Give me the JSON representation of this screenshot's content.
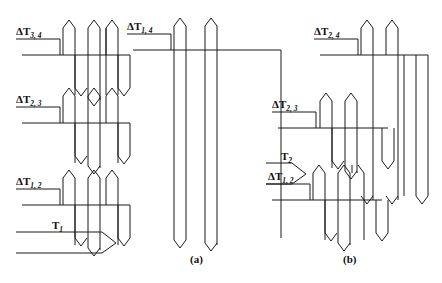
{
  "figure": {
    "type": "interdigital-transducer-diagram",
    "background_color": "#ffffff",
    "line_color": "#1a1a1a",
    "panels": [
      {
        "id": "a",
        "caption": "(a)",
        "labels": [
          {
            "name": "delta-t-3-4",
            "delta": "Δ",
            "symbol": "T",
            "sub": "3, 4"
          },
          {
            "name": "delta-t-2-3",
            "delta": "Δ",
            "symbol": "T",
            "sub": "2, 3"
          },
          {
            "name": "delta-t-1-2",
            "delta": "Δ",
            "symbol": "T",
            "sub": "1, 2"
          },
          {
            "name": "t-1",
            "delta": "",
            "symbol": "T",
            "sub": "1"
          },
          {
            "name": "delta-t-1-4",
            "delta": "Δ",
            "symbol": "T",
            "sub": "1, 4"
          }
        ]
      },
      {
        "id": "b",
        "caption": "(b)",
        "labels": [
          {
            "name": "delta-t-2-4",
            "delta": "Δ",
            "symbol": "T",
            "sub": "2, 4"
          },
          {
            "name": "delta-t-2-3",
            "delta": "Δ",
            "symbol": "T",
            "sub": "2, 3"
          },
          {
            "name": "t-2",
            "delta": "",
            "symbol": "T",
            "sub": "2"
          },
          {
            "name": "delta-t-1-2",
            "delta": "Δ",
            "symbol": "T",
            "sub": "1, 2"
          }
        ]
      }
    ],
    "label_text": {
      "delta_t_3_4": "ΔT",
      "delta_t_3_4_sub": "3, 4",
      "delta_t_2_3_a": "ΔT",
      "delta_t_2_3_a_sub": "2, 3",
      "delta_t_1_2_a": "ΔT",
      "delta_t_1_2_a_sub": "1, 2",
      "t_1": "T",
      "t_1_sub": "1",
      "delta_t_1_4": "ΔT",
      "delta_t_1_4_sub": "1, 4",
      "delta_t_2_4": "ΔT",
      "delta_t_2_4_sub": "2, 4",
      "delta_t_2_3_b": "ΔT",
      "delta_t_2_3_b_sub": "2, 3",
      "t_2": "T",
      "t_2_sub": "2",
      "delta_t_1_2_b": "ΔT",
      "delta_t_1_2_b_sub": "1, 2",
      "caption_a": "(a)",
      "caption_b": "(b)"
    }
  }
}
